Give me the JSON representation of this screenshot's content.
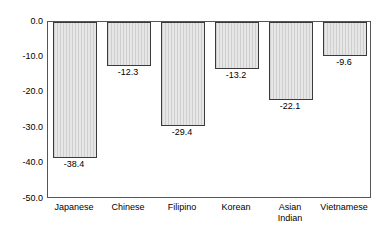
{
  "chart_data": {
    "type": "bar",
    "title": "",
    "subtitle": "",
    "xlabel": "",
    "ylabel": "",
    "categories": [
      "Japanese",
      "Chinese",
      "Filipino",
      "Korean",
      "Asian Indian",
      "Vietnamese"
    ],
    "values": [
      -38.4,
      -12.3,
      -29.4,
      -13.2,
      -22.1,
      -9.6
    ],
    "data_labels": [
      "-38.4",
      "-12.3",
      "-29.4",
      "-13.2",
      "-22.1",
      "-9.6"
    ],
    "ylim": [
      -50.0,
      0.0
    ],
    "yticks": [
      0.0,
      -10.0,
      -20.0,
      -30.0,
      -40.0,
      -50.0
    ],
    "ytick_labels": [
      "0.0",
      "-10.0",
      "-20.0",
      "-30.0",
      "-40.0",
      "-50.0"
    ],
    "grid": false,
    "legend": null,
    "bar_fill": "#d9d9d9",
    "bar_pattern": "vertical-lines",
    "bar_border": "#3a3a3a",
    "plot_border": "#555555",
    "background": "#ffffff"
  },
  "axis": {
    "y_labels": [
      {
        "text": "0.0",
        "value": 0.0
      },
      {
        "text": "-10.0",
        "value": -10.0
      },
      {
        "text": "-20.0",
        "value": -20.0
      },
      {
        "text": "-30.0",
        "value": -30.0
      },
      {
        "text": "-40.0",
        "value": -40.0
      },
      {
        "text": "-50.0",
        "value": -50.0
      }
    ],
    "x_labels": [
      {
        "text": "Japanese"
      },
      {
        "text": "Chinese"
      },
      {
        "text": "Filipino"
      },
      {
        "text": "Korean"
      },
      {
        "text": "Asian\nIndian"
      },
      {
        "text": "Vietnamese"
      }
    ]
  }
}
